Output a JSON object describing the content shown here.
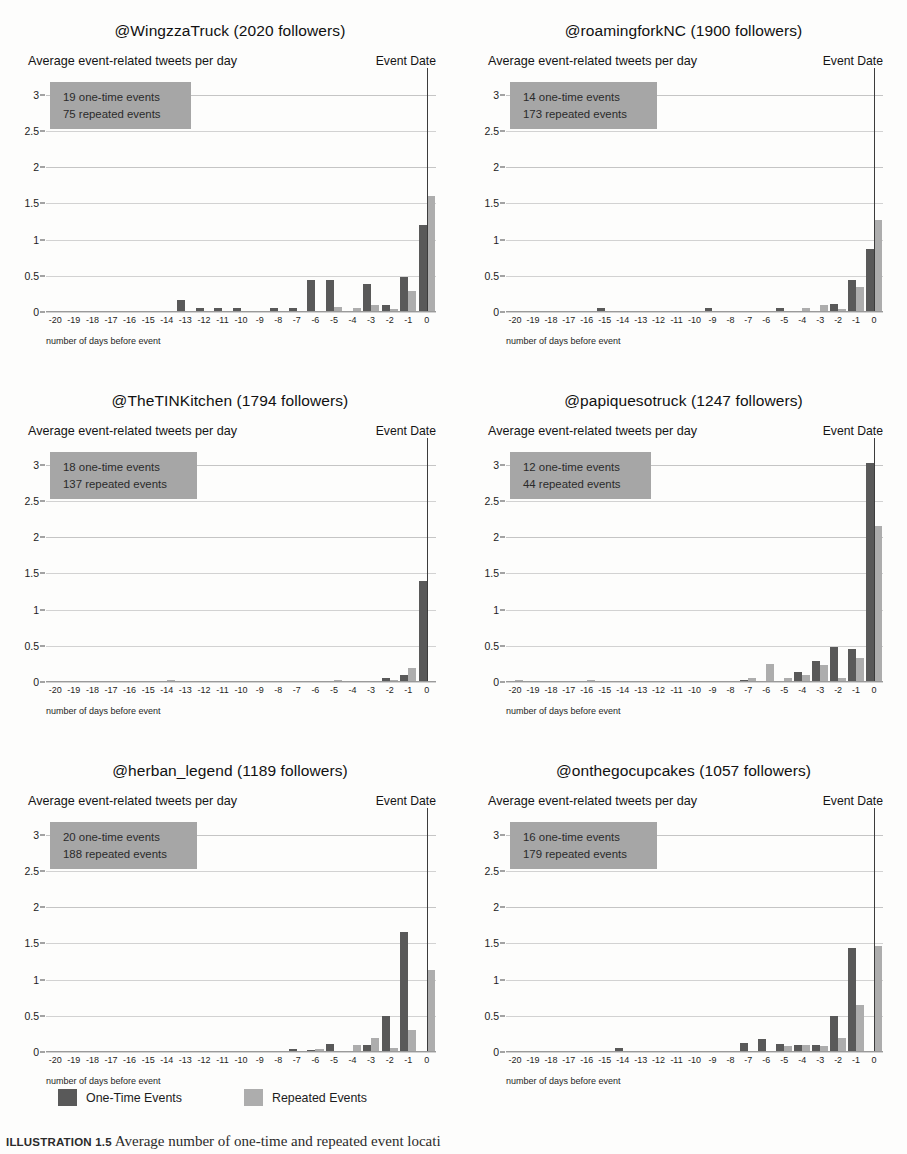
{
  "figure": {
    "caption_label": "ILLUSTRATION 1.5",
    "caption_text": "Average number of one-time and repeated event locati",
    "legend": {
      "one_time_label": "One-Time Events",
      "repeated_label": "Repeated Events",
      "one_time_color": "#595959",
      "repeated_color": "#adadad"
    },
    "shared": {
      "subtitle_left": "Average event-related tweets per day",
      "subtitle_right": "Event Date",
      "xlabel": "number of days before event",
      "annotation_bg": "#a6a6a6"
    }
  },
  "chart_data": [
    {
      "type": "bar",
      "title": "@WingzzaTruck (2020 followers)",
      "handle": "@WingzzaTruck",
      "followers": 2020,
      "annotation": [
        "19 one-time events",
        "75 repeated events"
      ],
      "one_time_events": 19,
      "repeated_events": 75,
      "subtitle": "Average event-related tweets per day",
      "event_date_label": "Event Date",
      "xlabel": "number of days before event",
      "ylabel": "",
      "ylim": [
        0,
        3.2
      ],
      "yticks": [
        0,
        0.5,
        1,
        1.5,
        2,
        2.5,
        3
      ],
      "ytick_labels": [
        "0",
        "0.5",
        "1",
        "1.5",
        "2",
        "2.5",
        "3"
      ],
      "grid": true,
      "legend_position": "figure-bottom",
      "categories": [
        "-20",
        "-19",
        "-18",
        "-17",
        "-16",
        "-15",
        "-14",
        "-13",
        "-12",
        "-11",
        "-10",
        "-9",
        "-8",
        "-7",
        "-6",
        "-5",
        "-4",
        "-3",
        "-2",
        "-1",
        "0"
      ],
      "series": [
        {
          "name": "One-Time Events",
          "values": [
            0,
            0,
            0,
            0,
            0,
            0,
            0,
            0.16,
            0.05,
            0.05,
            0.05,
            0,
            0.05,
            0.05,
            0.44,
            0.44,
            0.02,
            0.38,
            0.09,
            0.48,
            1.2
          ]
        },
        {
          "name": "Repeated Events",
          "values": [
            0,
            0.02,
            0,
            0,
            0.01,
            0,
            0,
            0,
            0,
            0,
            0,
            0,
            0.02,
            0.02,
            0.02,
            0.07,
            0.06,
            0.09,
            0.04,
            0.29,
            1.6
          ]
        }
      ]
    },
    {
      "type": "bar",
      "title": "@roamingforkNC (1900 followers)",
      "handle": "@roamingforkNC",
      "followers": 1900,
      "annotation": [
        "14 one-time events",
        "173 repeated events"
      ],
      "one_time_events": 14,
      "repeated_events": 173,
      "subtitle": "Average event-related tweets per day",
      "event_date_label": "Event Date",
      "xlabel": "number of days before event",
      "ylabel": "",
      "ylim": [
        0,
        3.2
      ],
      "yticks": [
        0,
        0.5,
        1,
        1.5,
        2,
        2.5,
        3
      ],
      "ytick_labels": [
        "0",
        "0.5",
        "1",
        "1.5",
        "2",
        "2.5",
        "3"
      ],
      "grid": true,
      "legend_position": "figure-bottom",
      "categories": [
        "-20",
        "-19",
        "-18",
        "-17",
        "-16",
        "-15",
        "-14",
        "-13",
        "-12",
        "-11",
        "-10",
        "-9",
        "-8",
        "-7",
        "-6",
        "-5",
        "-4",
        "-3",
        "-2",
        "-1",
        "0"
      ],
      "series": [
        {
          "name": "One-Time Events",
          "values": [
            0,
            0,
            0,
            0,
            0,
            0.06,
            0,
            0,
            0,
            0,
            0,
            0.06,
            0,
            0,
            0,
            0.06,
            0,
            0,
            0.11,
            0.44,
            0.87
          ]
        },
        {
          "name": "Repeated Events",
          "values": [
            0,
            0,
            0,
            0,
            0,
            0,
            0,
            0,
            0,
            0,
            0,
            0,
            0,
            0.01,
            0.01,
            0.02,
            0.05,
            0.09,
            0.04,
            0.35,
            1.27
          ]
        }
      ]
    },
    {
      "type": "bar",
      "title": "@TheTINKitchen (1794 followers)",
      "handle": "@TheTINKitchen",
      "followers": 1794,
      "annotation": [
        "18 one-time events",
        "137 repeated events"
      ],
      "one_time_events": 18,
      "repeated_events": 137,
      "subtitle": "Average event-related tweets per day",
      "event_date_label": "Event Date",
      "xlabel": "number of days before event",
      "ylabel": "",
      "ylim": [
        0,
        3.2
      ],
      "yticks": [
        0,
        0.5,
        1,
        1.5,
        2,
        2.5,
        3
      ],
      "ytick_labels": [
        "0",
        "0.5",
        "1",
        "1.5",
        "2",
        "2.5",
        "3"
      ],
      "grid": true,
      "legend_position": "figure-bottom",
      "categories": [
        "-20",
        "-19",
        "-18",
        "-17",
        "-16",
        "-15",
        "-14",
        "-13",
        "-12",
        "-11",
        "-10",
        "-9",
        "-8",
        "-7",
        "-6",
        "-5",
        "-4",
        "-3",
        "-2",
        "-1",
        "0"
      ],
      "series": [
        {
          "name": "One-Time Events",
          "values": [
            0,
            0,
            0,
            0,
            0,
            0,
            0,
            0,
            0,
            0,
            0,
            0,
            0,
            0,
            0,
            0,
            0,
            0,
            0.05,
            0.1,
            1.4
          ]
        },
        {
          "name": "Repeated Events",
          "values": [
            0,
            0,
            0,
            0,
            0,
            0,
            0.03,
            0,
            0,
            0,
            0,
            0,
            0.01,
            0.01,
            0.01,
            0.03,
            0.02,
            0.02,
            0.03,
            0.2,
            0
          ]
        }
      ]
    },
    {
      "type": "bar",
      "title": "@papiquesotruck (1247 followers)",
      "handle": "@papiquesotruck",
      "followers": 1247,
      "annotation": [
        "12 one-time events",
        "44 repeated events"
      ],
      "one_time_events": 12,
      "repeated_events": 44,
      "subtitle": "Average event-related tweets per day",
      "event_date_label": "Event Date",
      "xlabel": "number of days before event",
      "ylabel": "",
      "ylim": [
        0,
        3.2
      ],
      "yticks": [
        0,
        0.5,
        1,
        1.5,
        2,
        2.5,
        3
      ],
      "ytick_labels": [
        "0",
        "0.5",
        "1",
        "1.5",
        "2",
        "2.5",
        "3"
      ],
      "grid": true,
      "legend_position": "figure-bottom",
      "categories": [
        "-20",
        "-19",
        "-18",
        "-17",
        "-16",
        "-15",
        "-14",
        "-13",
        "-12",
        "-11",
        "-10",
        "-9",
        "-8",
        "-7",
        "-6",
        "-5",
        "-4",
        "-3",
        "-2",
        "-1",
        "0"
      ],
      "series": [
        {
          "name": "One-Time Events",
          "values": [
            0,
            0,
            0,
            0,
            0,
            0,
            0,
            0,
            0,
            0,
            0,
            0,
            0,
            0.03,
            0.02,
            0,
            0.14,
            0.29,
            0.48,
            0.45,
            3.02
          ]
        },
        {
          "name": "Repeated Events",
          "values": [
            0.03,
            0,
            0,
            0,
            0.03,
            0,
            0,
            0,
            0,
            0,
            0,
            0,
            0,
            0.05,
            0.25,
            0.06,
            0.09,
            0.24,
            0.06,
            0.33,
            2.15
          ]
        }
      ]
    },
    {
      "type": "bar",
      "title": "@herban_legend (1189 followers)",
      "handle": "@herban_legend",
      "followers": 1189,
      "annotation": [
        "20 one-time events",
        "188 repeated events"
      ],
      "one_time_events": 20,
      "repeated_events": 188,
      "subtitle": "Average event-related tweets per day",
      "event_date_label": "Event Date",
      "xlabel": "number of days before event",
      "ylabel": "",
      "ylim": [
        0,
        3.2
      ],
      "yticks": [
        0,
        0.5,
        1,
        1.5,
        2,
        2.5,
        3
      ],
      "ytick_labels": [
        "0",
        "0.5",
        "1",
        "1.5",
        "2",
        "2.5",
        "3"
      ],
      "grid": true,
      "legend_position": "figure-bottom",
      "categories": [
        "-20",
        "-19",
        "-18",
        "-17",
        "-16",
        "-15",
        "-14",
        "-13",
        "-12",
        "-11",
        "-10",
        "-9",
        "-8",
        "-7",
        "-6",
        "-5",
        "-4",
        "-3",
        "-2",
        "-1",
        "0"
      ],
      "series": [
        {
          "name": "One-Time Events",
          "values": [
            0,
            0,
            0,
            0,
            0,
            0,
            0,
            0,
            0,
            0,
            0,
            0,
            0,
            0.04,
            0.03,
            0.11,
            0,
            0.09,
            0.5,
            1.66,
            0
          ]
        },
        {
          "name": "Repeated Events",
          "values": [
            0,
            0,
            0,
            0,
            0,
            0,
            0,
            0,
            0,
            0,
            0,
            0,
            0,
            0,
            0.04,
            0,
            0.09,
            0.2,
            0.06,
            0.3,
            1.13
          ]
        }
      ]
    },
    {
      "type": "bar",
      "title": "@onthegocupcakes (1057 followers)",
      "handle": "@onthegocupcakes",
      "followers": 1057,
      "annotation": [
        "16 one-time events",
        "179 repeated events"
      ],
      "one_time_events": 16,
      "repeated_events": 179,
      "subtitle": "Average event-related tweets per day",
      "event_date_label": "Event Date",
      "xlabel": "number of days before event",
      "ylabel": "",
      "ylim": [
        0,
        3.2
      ],
      "yticks": [
        0,
        0.5,
        1,
        1.5,
        2,
        2.5,
        3
      ],
      "ytick_labels": [
        "0",
        "0.5",
        "1",
        "1.5",
        "2",
        "2.5",
        "3"
      ],
      "grid": true,
      "legend_position": "figure-bottom",
      "categories": [
        "-20",
        "-19",
        "-18",
        "-17",
        "-16",
        "-15",
        "-14",
        "-13",
        "-12",
        "-11",
        "-10",
        "-9",
        "-8",
        "-7",
        "-6",
        "-5",
        "-4",
        "-3",
        "-2",
        "-1",
        "0"
      ],
      "series": [
        {
          "name": "One-Time Events",
          "values": [
            0,
            0,
            0,
            0,
            0,
            0,
            0.05,
            0,
            0,
            0,
            0,
            0,
            0,
            0.13,
            0.18,
            0.11,
            0.1,
            0.09,
            0.5,
            1.44,
            0
          ]
        },
        {
          "name": "Repeated Events",
          "values": [
            0,
            0,
            0,
            0,
            0,
            0,
            0,
            0,
            0,
            0,
            0,
            0,
            0,
            0,
            0,
            0.08,
            0.1,
            0.08,
            0.2,
            0.65,
            1.46
          ]
        }
      ]
    }
  ]
}
